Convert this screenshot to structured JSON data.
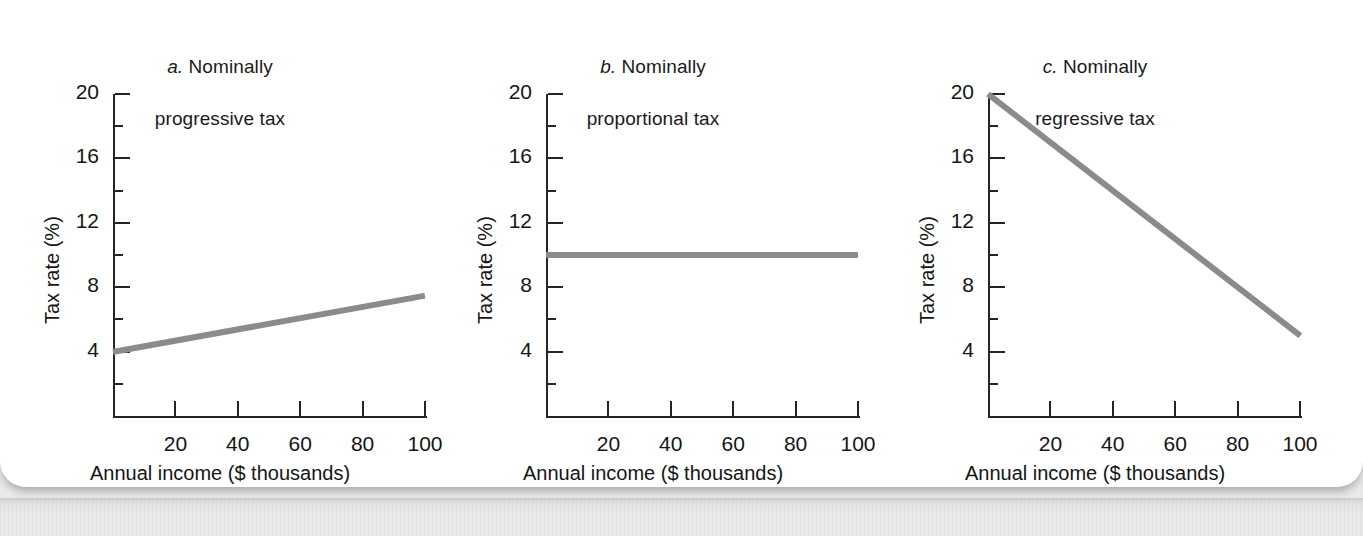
{
  "figure": {
    "background_color": "#ffffff",
    "outer_color": "#e9e9ea",
    "line_color": "#8b8b8b",
    "axis_color": "#252525"
  },
  "chart_data": [
    {
      "type": "line",
      "panel_id": "a",
      "panel_letter": "a.",
      "title": "a. Nominally\nprogressive tax",
      "title_line1": "a. Nominally",
      "title_line2": "progressive tax",
      "xlabel": "Annual income ($ thousands)",
      "ylabel": "Tax rate (%)",
      "xlim": [
        0,
        100
      ],
      "ylim": [
        0,
        20
      ],
      "xticks": [
        20,
        40,
        60,
        80,
        100
      ],
      "xtick_labels": [
        "20",
        "40",
        "60",
        "80",
        "100"
      ],
      "yticks": [
        4,
        8,
        12,
        16,
        20
      ],
      "ytick_labels": [
        "4",
        "8",
        "12",
        "16",
        "20"
      ],
      "yticks_minor": [
        2,
        6,
        10,
        14,
        18
      ],
      "grid": false,
      "legend": "none",
      "x": [
        0,
        100
      ],
      "values": [
        4.0,
        7.5
      ],
      "series": [
        {
          "name": "Nominally progressive tax",
          "x": [
            0,
            100
          ],
          "values": [
            4.0,
            7.5
          ]
        }
      ]
    },
    {
      "type": "line",
      "panel_id": "b",
      "panel_letter": "b.",
      "title": "b. Nominally\nproportional tax",
      "title_line1": "b. Nominally",
      "title_line2": "proportional tax",
      "xlabel": "Annual income ($ thousands)",
      "ylabel": "Tax rate (%)",
      "xlim": [
        0,
        100
      ],
      "ylim": [
        0,
        20
      ],
      "xticks": [
        20,
        40,
        60,
        80,
        100
      ],
      "xtick_labels": [
        "20",
        "40",
        "60",
        "80",
        "100"
      ],
      "yticks": [
        4,
        8,
        12,
        16,
        20
      ],
      "ytick_labels": [
        "4",
        "8",
        "12",
        "16",
        "20"
      ],
      "yticks_minor": [
        2,
        6,
        10,
        14,
        18
      ],
      "grid": false,
      "legend": "none",
      "x": [
        0,
        100
      ],
      "values": [
        10.0,
        10.0
      ],
      "series": [
        {
          "name": "Nominally proportional tax",
          "x": [
            0,
            100
          ],
          "values": [
            10.0,
            10.0
          ]
        }
      ]
    },
    {
      "type": "line",
      "panel_id": "c",
      "panel_letter": "c.",
      "title": "c. Nominally\nregressive tax",
      "title_line1": "c. Nominally",
      "title_line2": "regressive tax",
      "xlabel": "Annual income ($ thousands)",
      "ylabel": "Tax rate (%)",
      "xlim": [
        0,
        100
      ],
      "ylim": [
        0,
        20
      ],
      "xticks": [
        20,
        40,
        60,
        80,
        100
      ],
      "xtick_labels": [
        "20",
        "40",
        "60",
        "80",
        "100"
      ],
      "yticks": [
        4,
        8,
        12,
        16,
        20
      ],
      "ytick_labels": [
        "4",
        "8",
        "12",
        "16",
        "20"
      ],
      "yticks_minor": [
        2,
        6,
        10,
        14,
        18
      ],
      "grid": false,
      "legend": "none",
      "x": [
        0,
        100
      ],
      "values": [
        20.0,
        5.0
      ],
      "series": [
        {
          "name": "Nominally regressive tax",
          "x": [
            0,
            100
          ],
          "values": [
            20.0,
            5.0
          ]
        }
      ]
    }
  ]
}
